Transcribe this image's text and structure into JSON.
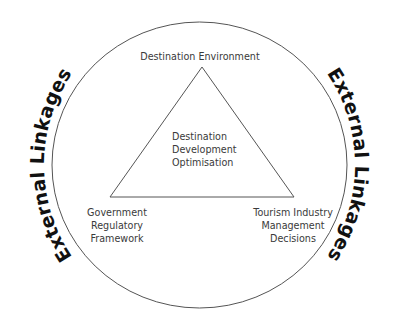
{
  "diagram": {
    "outer_ring_label_left": "External Linkages",
    "outer_ring_label_right": "External Linkages",
    "top_vertex_label": "Destination Environment",
    "center_label": [
      "Destination",
      "Development",
      "Optimisation"
    ],
    "bottom_left_label": [
      "Government",
      "Regulatory",
      "Framework"
    ],
    "bottom_right_label": [
      "Tourism Industry",
      "Management",
      "Decisions"
    ]
  },
  "colors": {
    "stroke": "#555555",
    "text": "#3a3a3a",
    "ring_text": "#111111",
    "background": "#ffffff"
  }
}
